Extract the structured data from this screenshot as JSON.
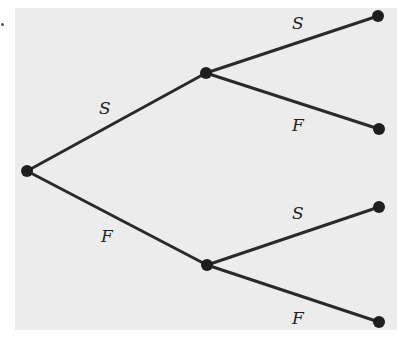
{
  "diagram": {
    "type": "probability-tree",
    "background_color": "#ececec",
    "line_color": "#2a2a2a",
    "node_color": "#1e1e1e",
    "nodes": [
      {
        "id": "root",
        "x": 27,
        "y": 171
      },
      {
        "id": "mid-upper",
        "x": 206,
        "y": 73
      },
      {
        "id": "mid-lower",
        "x": 207,
        "y": 265
      },
      {
        "id": "leaf-1",
        "x": 378,
        "y": 16
      },
      {
        "id": "leaf-2",
        "x": 379,
        "y": 129
      },
      {
        "id": "leaf-3",
        "x": 379,
        "y": 207
      },
      {
        "id": "leaf-4",
        "x": 379,
        "y": 322
      }
    ],
    "edges": [
      {
        "from": "root",
        "to": "mid-upper",
        "label": "S",
        "label_x": 99,
        "label_y": 114
      },
      {
        "from": "root",
        "to": "mid-lower",
        "label": "F",
        "label_x": 101,
        "label_y": 242
      },
      {
        "from": "mid-upper",
        "to": "leaf-1",
        "label": "S",
        "label_x": 292,
        "label_y": 29
      },
      {
        "from": "mid-upper",
        "to": "leaf-2",
        "label": "F",
        "label_x": 292,
        "label_y": 131
      },
      {
        "from": "mid-lower",
        "to": "leaf-3",
        "label": "S",
        "label_x": 292,
        "label_y": 219
      },
      {
        "from": "mid-lower",
        "to": "leaf-4",
        "label": "F",
        "label_x": 292,
        "label_y": 324
      }
    ]
  }
}
